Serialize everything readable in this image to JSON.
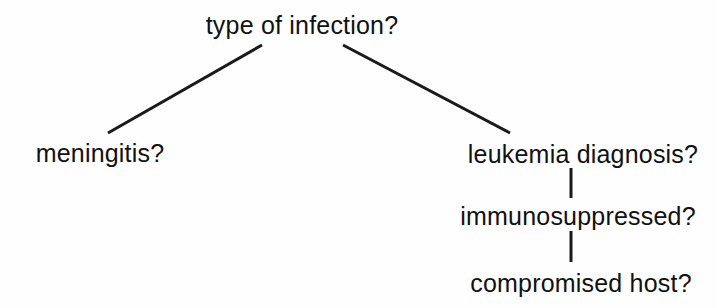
{
  "diagram": {
    "type": "decision-tree",
    "title": "type of infection?",
    "background_color": "#fefefe",
    "text_color": "#111111",
    "edge_color": "#1a1a1a",
    "nodes": [
      {
        "id": "root",
        "label": "type of infection?",
        "level": 0,
        "x": 302,
        "y": 26
      },
      {
        "id": "left-child",
        "label": "meningitis?",
        "level": 1,
        "x": 100,
        "y": 154
      },
      {
        "id": "right-child",
        "label": "leukemia diagnosis?",
        "level": 1,
        "x": 583,
        "y": 155
      },
      {
        "id": "right-child-2",
        "label": "immunosuppressed?",
        "level": 2,
        "x": 578,
        "y": 217
      },
      {
        "id": "right-child-3",
        "label": "compromised host?",
        "level": 3,
        "x": 581,
        "y": 284
      }
    ],
    "edges": [
      {
        "id": "edge-root-to-meningitis",
        "from": "root",
        "to": "left-child",
        "kind": "diagonal",
        "x1": 262,
        "y1": 45,
        "x2": 108,
        "y2": 133
      },
      {
        "id": "edge-root-to-leukemia",
        "from": "root",
        "to": "right-child",
        "kind": "diagonal",
        "x1": 343,
        "y1": 45,
        "x2": 510,
        "y2": 133
      },
      {
        "id": "edge-leukemia-to-immunosuppressed",
        "from": "right-child",
        "to": "right-child-2",
        "kind": "vertical",
        "x1": 571,
        "y1": 168,
        "x2": 571,
        "y2": 198
      },
      {
        "id": "edge-immunosuppressed-to-compromised",
        "from": "right-child-2",
        "to": "right-child-3",
        "kind": "vertical",
        "x1": 571,
        "y1": 231,
        "x2": 571,
        "y2": 262
      }
    ]
  }
}
